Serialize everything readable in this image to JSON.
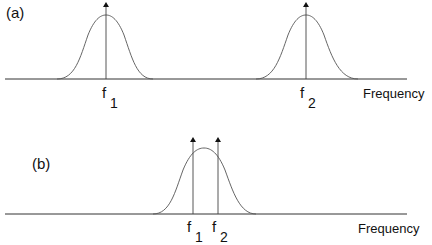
{
  "panels": [
    {
      "label": "(a)",
      "axis_label": "Frequency",
      "carriers": [
        {
          "name": "f",
          "subscript": "1"
        },
        {
          "name": "f",
          "subscript": "2"
        }
      ],
      "description": "Two separated Gaussian spectra, each centered on its own carrier arrow"
    },
    {
      "label": "(b)",
      "axis_label": "Frequency",
      "carriers": [
        {
          "name": "f",
          "subscript": "1"
        },
        {
          "name": "f",
          "subscript": "2"
        }
      ],
      "description": "Single Gaussian spectrum containing two closely spaced carrier arrows"
    }
  ],
  "colors": {
    "line": "#222222",
    "curve": "#555555",
    "background": "#ffffff"
  }
}
